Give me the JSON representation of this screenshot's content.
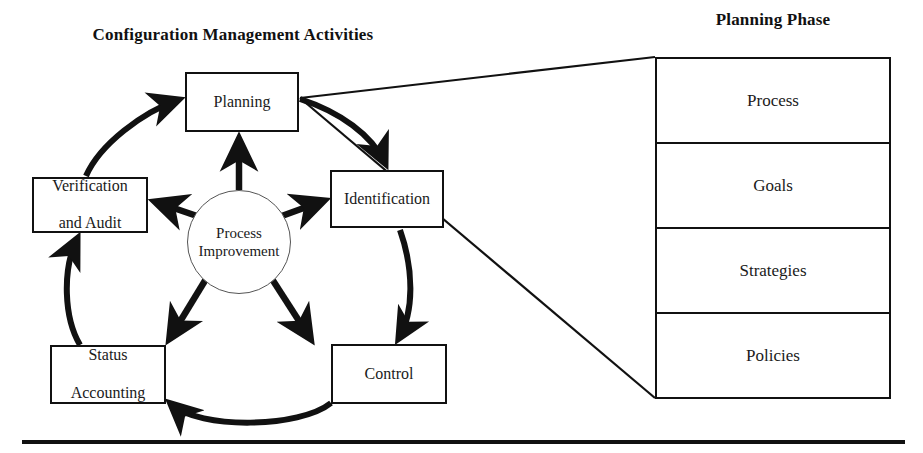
{
  "headings": {
    "left_title": "Configuration Management Activities",
    "right_title": "Planning Phase"
  },
  "cycle": {
    "center": {
      "line1": "Process",
      "line2": "Improvement"
    },
    "nodes": [
      {
        "id": "planning",
        "label": "Planning"
      },
      {
        "id": "identification",
        "label": "Identification"
      },
      {
        "id": "control",
        "label": "Control"
      },
      {
        "id": "status-accounting",
        "line1": "Status",
        "line2": "Accounting"
      },
      {
        "id": "verification-and-audit",
        "line1": "Verification",
        "line2": "and Audit"
      }
    ]
  },
  "planning_phase_table": {
    "rows": [
      "Process",
      "Goals",
      "Strategies",
      "Policies"
    ]
  },
  "colors": {
    "stroke": "#111111",
    "background": "#ffffff",
    "circle_stroke": "#555555",
    "text": "#1a1a1a"
  }
}
